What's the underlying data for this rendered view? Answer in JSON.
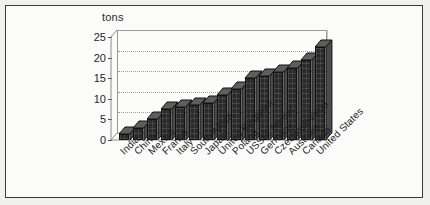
{
  "chart_data": {
    "type": "bar",
    "title": "",
    "subtitle": "",
    "xlabel": "",
    "ylabel": "tons",
    "ylim": [
      0,
      25
    ],
    "yticks": [
      0,
      5,
      10,
      15,
      20,
      25
    ],
    "grid": true,
    "legend": null,
    "orientation": "vertical",
    "style": "3d-bar",
    "categories": [
      "India",
      "China",
      "Mexico",
      "France",
      "Italy",
      "South Africa",
      "Japan",
      "United Kingdom",
      "Poland",
      "USSR, former",
      "Germany",
      "Czechoslovakia",
      "Australia",
      "Canada",
      "United States"
    ],
    "values": [
      1.5,
      3,
      5,
      7.5,
      8,
      8.5,
      9,
      11,
      12.5,
      15,
      15.5,
      16.5,
      17.5,
      19.5,
      22.5
    ]
  },
  "axis": {
    "y_unit_caption": "tons",
    "tick_labels": [
      "25",
      "20",
      "15",
      "10",
      "5",
      "0"
    ]
  },
  "colors": {
    "page_background": "#f0f0ee",
    "frame_border": "#3a3a3a",
    "plot_background": "#fcfcfb",
    "bar_fill": "#2a2a2a",
    "bar_side": "#4a4a4a",
    "bar_top": "#5e5e5e",
    "gridline": "#9f9f9f",
    "text": "#1e1e1e"
  }
}
